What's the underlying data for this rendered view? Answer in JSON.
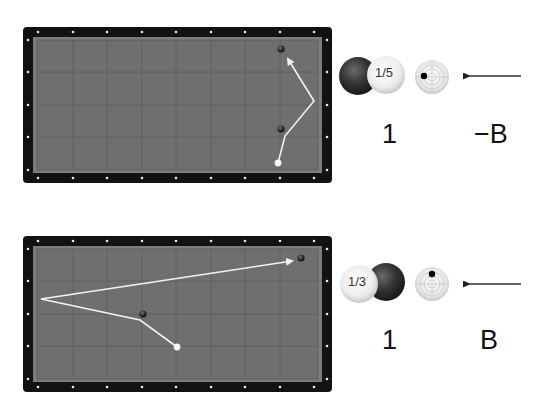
{
  "colors": {
    "frame": "#121212",
    "rail": "#7c7c7c",
    "cloth": "#6f6f6f",
    "grid": "#5e5e5e",
    "path": "#f2f2f2",
    "diamond": "#e8e8e8",
    "object_ball": "#2e2e2e",
    "cue_ball": "#f5f5f5"
  },
  "diagrams": [
    {
      "id": "shot-1",
      "cue_ball": {
        "x": 278,
        "y": 163
      },
      "object_balls": [
        {
          "x": 281,
          "y": 49
        },
        {
          "x": 281,
          "y": 129
        }
      ],
      "path": [
        [
          278,
          163
        ],
        [
          285,
          136
        ],
        [
          314,
          101
        ],
        [
          287,
          58
        ]
      ],
      "contact": {
        "fraction_label": "1/5",
        "front_ball": "cue",
        "cue_side": "right"
      },
      "spin": {
        "dot_x": -8,
        "dot_y": -2,
        "position": "left"
      },
      "stroke_direction": "left",
      "speed_label": "1",
      "spin_label": "−B"
    },
    {
      "id": "shot-2",
      "cue_ball": {
        "x": 177,
        "y": 347
      },
      "object_balls": [
        {
          "x": 143,
          "y": 314
        },
        {
          "x": 301,
          "y": 258
        }
      ],
      "path": [
        [
          177,
          347
        ],
        [
          140,
          320
        ],
        [
          41,
          299
        ],
        [
          292,
          261
        ]
      ],
      "contact": {
        "fraction_label": "1/3",
        "front_ball": "cue",
        "cue_side": "left"
      },
      "spin": {
        "dot_x": 0,
        "dot_y": -10,
        "position": "top"
      },
      "stroke_direction": "left",
      "speed_label": "1",
      "spin_label": "B"
    }
  ],
  "labels": {
    "shot1_fraction": "1/5",
    "shot1_speed": "1",
    "shot1_spin": "−B",
    "shot2_fraction": "1/3",
    "shot2_speed": "1",
    "shot2_spin": "B"
  }
}
